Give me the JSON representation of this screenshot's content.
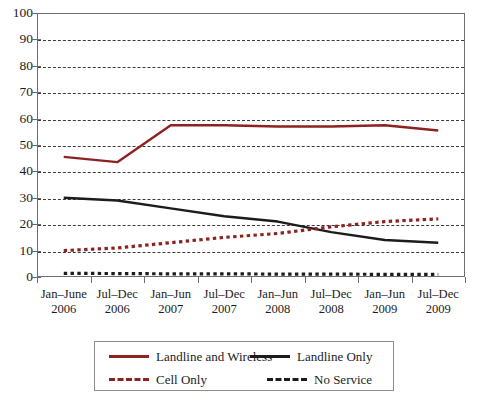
{
  "chart_data": {
    "type": "line",
    "title": "",
    "subtitle": "",
    "xlabel": "",
    "ylabel": "",
    "ylim": [
      0,
      100
    ],
    "yticks": [
      0,
      10,
      20,
      30,
      40,
      50,
      60,
      70,
      80,
      90,
      100
    ],
    "grid": true,
    "legend_position": "bottom",
    "categories": [
      "Jan–June 2006",
      "Jul–Dec 2006",
      "Jan–Jun 2007",
      "Jul–Dec 2007",
      "Jan–Jun 2008",
      "Jul–Dec 2008",
      "Jan–Jun 2009",
      "Jul–Dec 2009"
    ],
    "category_lines": [
      {
        "line1": "Jan–June",
        "line2": "2006"
      },
      {
        "line1": "Jul–Dec",
        "line2": "2006"
      },
      {
        "line1": "Jan–Jun",
        "line2": "2007"
      },
      {
        "line1": "Jul–Dec",
        "line2": "2007"
      },
      {
        "line1": "Jan–Jun",
        "line2": "2008"
      },
      {
        "line1": "Jul–Dec",
        "line2": "2008"
      },
      {
        "line1": "Jan–Jun",
        "line2": "2009"
      },
      {
        "line1": "Jul–Dec",
        "line2": "2009"
      }
    ],
    "series": [
      {
        "name": "Landline and Wireless",
        "color": "#8e2222",
        "style": "solid",
        "values": [
          45.5,
          43.5,
          57.5,
          57.5,
          57,
          57,
          57.5,
          55.5
        ]
      },
      {
        "name": "Landline Only",
        "color": "#1c1c1c",
        "style": "solid",
        "values": [
          30,
          29,
          26,
          23,
          21,
          17,
          14,
          13
        ]
      },
      {
        "name": "Cell Only",
        "color": "#8e2222",
        "style": "dashed",
        "values": [
          10,
          11,
          13,
          15,
          16.5,
          19,
          21,
          22
        ]
      },
      {
        "name": "No Service",
        "color": "#1c1c1c",
        "style": "dashed",
        "values": [
          1.4,
          1.3,
          1.2,
          1.2,
          1.1,
          1.1,
          1.0,
          1.0
        ]
      }
    ]
  },
  "legend": {
    "items": [
      {
        "label": "Landline and Wireless",
        "swatch": "solid-red"
      },
      {
        "label": "Landline Only",
        "swatch": "solid-black"
      },
      {
        "label": "Cell Only",
        "swatch": "dash-red"
      },
      {
        "label": "No Service",
        "swatch": "dash-black"
      }
    ]
  },
  "colors": {
    "series_red": "#8e2222",
    "series_black": "#1c1c1c",
    "axis": "#6e6e6e",
    "gridline": "#3a3a3a",
    "background": "#ffffff"
  }
}
